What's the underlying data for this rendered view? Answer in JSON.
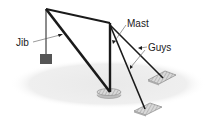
{
  "diagram": {
    "type": "guyed derrick crane",
    "labels": {
      "jib": "Jib",
      "mast": "Mast",
      "guys": "Guys"
    },
    "colors": {
      "structure": "#1a1a1a",
      "ground": "#ececec",
      "weight": "#555555",
      "platform": "#d8d8d8",
      "leader": "#555555"
    }
  }
}
